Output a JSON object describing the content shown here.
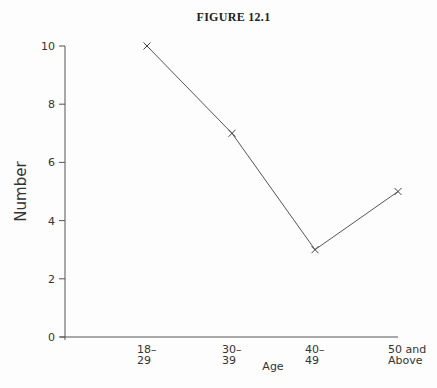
{
  "chart_data": {
    "type": "line",
    "title": "FIGURE 12.1",
    "xlabel": "Age",
    "ylabel": "Number",
    "categories": [
      "18–29",
      "30–39",
      "40–49",
      "50 and Above"
    ],
    "category_lines": [
      [
        "18–",
        "29"
      ],
      [
        "30–",
        "39"
      ],
      [
        "40–",
        "49"
      ],
      [
        "50 and",
        "Above"
      ]
    ],
    "values": [
      10,
      7,
      3,
      5
    ],
    "ylim": [
      0,
      10
    ],
    "yticks": [
      0,
      2,
      4,
      6,
      8,
      10
    ],
    "marker": "x",
    "grid": false,
    "legend": null
  }
}
